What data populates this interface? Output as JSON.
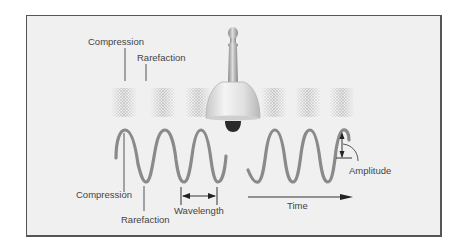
{
  "diagram": {
    "labels": {
      "compression_top": "Compression",
      "rarefaction_top": "Rarefaction",
      "compression_bottom": "Compression",
      "rarefaction_bottom": "Rarefaction",
      "wavelength": "Wavelength",
      "time": "Time",
      "amplitude": "Amplitude"
    },
    "colors": {
      "background": "#f0f0f0",
      "border": "#555555",
      "wave": "#8a8a8a",
      "text": "#444444",
      "leader": "#555555",
      "bell": "#d8d8d8",
      "clapper": "#2a2a2a"
    },
    "components": [
      {
        "name": "bell",
        "description": "hand bell at center emitting sound"
      },
      {
        "name": "compression-bands",
        "count": 6,
        "description": "stippled bands representing compressed air"
      },
      {
        "name": "wave-left",
        "description": "sinusoidal wave, left of bell"
      },
      {
        "name": "wave-right",
        "description": "sinusoidal wave, right of bell"
      },
      {
        "name": "wavelength-arrow",
        "description": "double-headed arrow between two troughs"
      },
      {
        "name": "time-arrow",
        "description": "arrow pointing right under right wave"
      },
      {
        "name": "amplitude-marker",
        "description": "vertical double arrow at final crest"
      }
    ]
  }
}
